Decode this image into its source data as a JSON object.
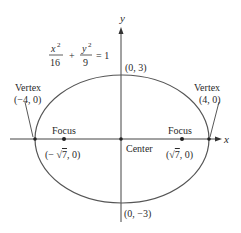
{
  "diagram": {
    "type": "ellipse",
    "equation": {
      "x_num": "x",
      "x_exp": "2",
      "x_den": "16",
      "plus": "+",
      "y_num": "y",
      "y_exp": "2",
      "y_den": "9",
      "rhs": "= 1"
    },
    "axes": {
      "x_label": "x",
      "y_label": "y"
    },
    "points": {
      "top": {
        "label": "(0, 3)"
      },
      "bottom": {
        "label": "(0, −3)"
      },
      "left_vertex": {
        "title": "Vertex",
        "label": "(−4, 0)"
      },
      "right_vertex": {
        "title": "Vertex",
        "label": "(4, 0)"
      },
      "left_focus": {
        "title": "Focus",
        "label_pre": "(− ",
        "label_rad": "7",
        "label_post": ", 0)"
      },
      "right_focus": {
        "title": "Focus",
        "label_pre": "(",
        "label_rad": "7",
        "label_post": ", 0)"
      },
      "center": {
        "label": "Center"
      }
    },
    "colors": {
      "stroke": "#555555",
      "text": "#2a2a2a",
      "point": "#222222"
    }
  }
}
